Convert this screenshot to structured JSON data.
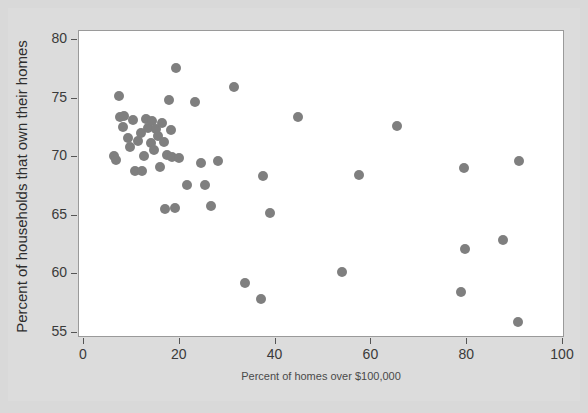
{
  "chart_data": {
    "type": "scatter",
    "title": "",
    "xlabel": "Percent of homes over $100,000",
    "ylabel": "Percent of households that own their homes",
    "xlim": [
      0,
      100
    ],
    "ylim": [
      53.5,
      81
    ],
    "xticks": [
      0,
      20,
      40,
      60,
      80,
      100
    ],
    "yticks": [
      55,
      60,
      65,
      70,
      75,
      80
    ],
    "xtick_labels": [
      "0",
      "20",
      "40",
      "60",
      "80",
      "100"
    ],
    "ytick_labels": [
      "55",
      "60",
      "65",
      "70",
      "75",
      "80"
    ],
    "grid": false,
    "legend": null,
    "marker": {
      "shape": "circle",
      "color": "#7f7f7f",
      "size_px": 10
    },
    "n_points": 51,
    "points": [
      {
        "x": 6.3,
        "y": 70.1
      },
      {
        "x": 6.7,
        "y": 69.8
      },
      {
        "x": 7.3,
        "y": 75.2
      },
      {
        "x": 7.6,
        "y": 73.4
      },
      {
        "x": 8.1,
        "y": 72.6
      },
      {
        "x": 8.4,
        "y": 73.5
      },
      {
        "x": 9.1,
        "y": 71.6
      },
      {
        "x": 9.5,
        "y": 70.9
      },
      {
        "x": 10.2,
        "y": 73.2
      },
      {
        "x": 10.6,
        "y": 68.8
      },
      {
        "x": 11.3,
        "y": 71.4
      },
      {
        "x": 11.8,
        "y": 72.1
      },
      {
        "x": 12.1,
        "y": 68.8
      },
      {
        "x": 12.6,
        "y": 70.1
      },
      {
        "x": 13.0,
        "y": 73.3
      },
      {
        "x": 13.4,
        "y": 72.5
      },
      {
        "x": 13.9,
        "y": 71.2
      },
      {
        "x": 14.2,
        "y": 73.1
      },
      {
        "x": 14.7,
        "y": 70.6
      },
      {
        "x": 15.1,
        "y": 72.4
      },
      {
        "x": 15.5,
        "y": 71.8
      },
      {
        "x": 15.9,
        "y": 69.2
      },
      {
        "x": 16.3,
        "y": 72.9
      },
      {
        "x": 16.7,
        "y": 71.3
      },
      {
        "x": 17.0,
        "y": 65.6
      },
      {
        "x": 17.4,
        "y": 70.2
      },
      {
        "x": 17.8,
        "y": 74.9
      },
      {
        "x": 18.1,
        "y": 72.3
      },
      {
        "x": 18.4,
        "y": 70.0
      },
      {
        "x": 18.9,
        "y": 65.7
      },
      {
        "x": 19.3,
        "y": 77.6
      },
      {
        "x": 19.8,
        "y": 69.9
      },
      {
        "x": 21.6,
        "y": 67.6
      },
      {
        "x": 23.1,
        "y": 74.7
      },
      {
        "x": 24.5,
        "y": 69.5
      },
      {
        "x": 25.2,
        "y": 67.6
      },
      {
        "x": 26.6,
        "y": 65.8
      },
      {
        "x": 28.0,
        "y": 69.7
      },
      {
        "x": 31.3,
        "y": 76.0
      },
      {
        "x": 33.6,
        "y": 59.3
      },
      {
        "x": 36.9,
        "y": 57.9
      },
      {
        "x": 37.4,
        "y": 68.4
      },
      {
        "x": 38.8,
        "y": 65.2
      },
      {
        "x": 44.7,
        "y": 73.4
      },
      {
        "x": 53.8,
        "y": 60.2
      },
      {
        "x": 57.4,
        "y": 68.5
      },
      {
        "x": 65.3,
        "y": 72.7
      },
      {
        "x": 78.8,
        "y": 58.5
      },
      {
        "x": 79.3,
        "y": 69.1
      },
      {
        "x": 79.5,
        "y": 62.2
      },
      {
        "x": 87.5,
        "y": 62.9
      },
      {
        "x": 90.6,
        "y": 55.9
      },
      {
        "x": 90.9,
        "y": 69.7
      }
    ]
  },
  "axes": {
    "x_title": "Percent of homes over $100,000",
    "y_title": "Percent of households that own their homes"
  }
}
